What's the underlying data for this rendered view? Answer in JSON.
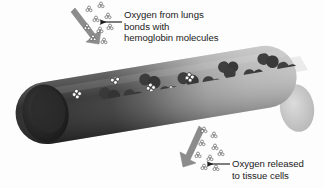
{
  "figure": {
    "background_color": "#fdfdfd"
  },
  "labels": {
    "top": {
      "line1": "Oxygen from lungs",
      "line2": "bonds with",
      "line3": "hemoglobin molecules"
    },
    "bottom": {
      "line1": "Oxygen released",
      "line2": "to tissue cells"
    }
  },
  "icons": {
    "oxygen_molecule": "oxygen-molecule-icon",
    "hemoglobin_molecule": "hemoglobin-molecule-icon",
    "flow_arrow_in": "arrow-into-vessel-icon",
    "flow_arrow_out": "arrow-out-of-vessel-icon",
    "leader_top": "leader-line-arrow-icon",
    "leader_bottom": "leader-line-arrow-icon"
  },
  "colors": {
    "vessel_dark": "#2d2d2d",
    "vessel_mid": "#6f6f6f",
    "vessel_light": "#b9b9b9",
    "vessel_cap_light": "#cfcfcf",
    "vessel_cap_dark": "#1e1e1e",
    "hemoglobin": "#3a3a3a",
    "oxygen_fill": "#fbfbfb",
    "oxygen_stroke": "#3a3a3a",
    "arrow_gray": "#8c8c8c",
    "leader_line": "#2a2a2a",
    "text": "#1b1b1b"
  },
  "vessel": {
    "description": "cylindrical blood vessel tilted down-left to up-right, dark (oxygen-rich/deoxygenated shading) at left opening, lightening toward the right end",
    "left_open_end": true,
    "right_rounded_end": true
  },
  "oxygen_clusters": {
    "free_above_vessel": 9,
    "bound_in_vessel": 8,
    "free_below_vessel": 9
  },
  "hemoglobin_count": 14
}
